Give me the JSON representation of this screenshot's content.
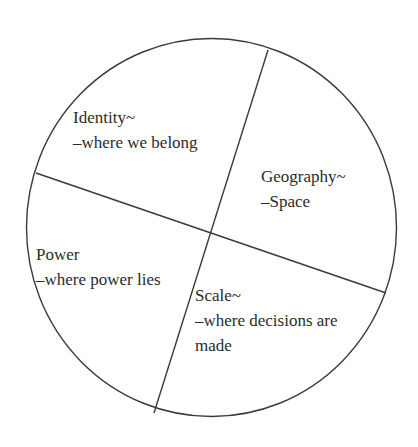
{
  "diagram": {
    "type": "circle-divided-into-four-sectors",
    "stroke_color": "#3a3a3a",
    "background_color": "#ffffff",
    "circle": {
      "cx": 211.5,
      "cy": 227.5,
      "rx": 185,
      "ry": 189
    },
    "dividers": [
      {
        "x1": 268,
        "y1": 50,
        "x2": 154,
        "y2": 413
      },
      {
        "x1": 36,
        "y1": 173,
        "x2": 386,
        "y2": 293
      }
    ],
    "sectors": [
      {
        "id": "identity",
        "title": "Identity~",
        "lines": [
          "–where we belong"
        ]
      },
      {
        "id": "geography",
        "title": "Geography~",
        "lines": [
          "–Space"
        ]
      },
      {
        "id": "power",
        "title": "Power",
        "lines": [
          "–where power lies"
        ]
      },
      {
        "id": "scale",
        "title": "Scale~",
        "lines": [
          "–where decisions are",
          "made"
        ]
      }
    ]
  }
}
